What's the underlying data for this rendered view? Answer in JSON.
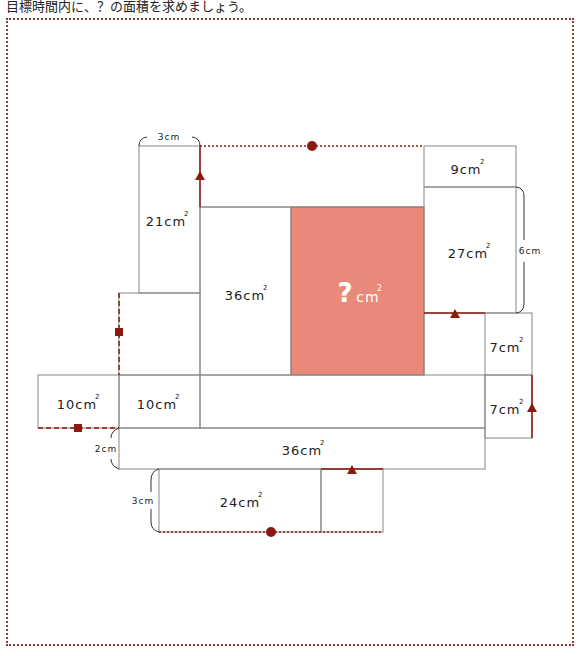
{
  "instruction": "目標時間内に、？の面積を求めましょう。",
  "colors": {
    "frame_border": "#8a3a30",
    "line": "#888888",
    "marker": "#8b1a10",
    "unknown_fill": "#e8897a",
    "unknown_text": "#ffffff"
  },
  "unit": "cm",
  "area_labels": {
    "a21": "21cm",
    "a36_top": "36cm",
    "unknown_q": "?",
    "unknown_unit": "cm",
    "a9": "9cm",
    "a27": "27cm",
    "a7_upper": "7cm",
    "a7_lower": "7cm",
    "a10_left": "10cm",
    "a10_right": "10cm",
    "a36_bottom": "36cm",
    "a24": "24cm",
    "squared": "2"
  },
  "dimension_labels": {
    "top_3cm": "3cm",
    "right_6cm": "6cm",
    "left_2cm": "2cm",
    "bottom_3cm": "3cm"
  },
  "markers": {
    "circle": "circle-marker",
    "square": "square-marker",
    "triangle": "triangle-marker"
  }
}
